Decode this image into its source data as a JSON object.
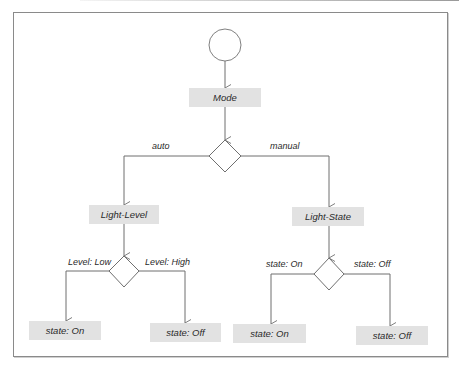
{
  "diagram": {
    "type": "flowchart",
    "start_node": {
      "shape": "circle"
    },
    "root": {
      "label": "Mode"
    },
    "decisions": {
      "mode": {
        "branches": [
          {
            "label": "auto",
            "target": "Light-Level"
          },
          {
            "label": "manual",
            "target": "Light-State"
          }
        ]
      },
      "light_level": {
        "branches": [
          {
            "label": "Level: Low",
            "target": "state: On"
          },
          {
            "label": "Level: High",
            "target": "state: Off"
          }
        ]
      },
      "light_state": {
        "branches": [
          {
            "label": "state: On",
            "target": "state: On"
          },
          {
            "label": "state: Off",
            "target": "state: Off"
          }
        ]
      }
    },
    "nodes": {
      "mode": "Mode",
      "light_level": "Light-Level",
      "light_state": "Light-State",
      "leaf_ll_on": "state: On",
      "leaf_ll_off": "state: Off",
      "leaf_ls_on": "state: On",
      "leaf_ls_off": "state: Off"
    },
    "colors": {
      "node_fill": "#e2e2e2",
      "line": "#6f6f6f",
      "text": "#2a2a2a"
    }
  }
}
